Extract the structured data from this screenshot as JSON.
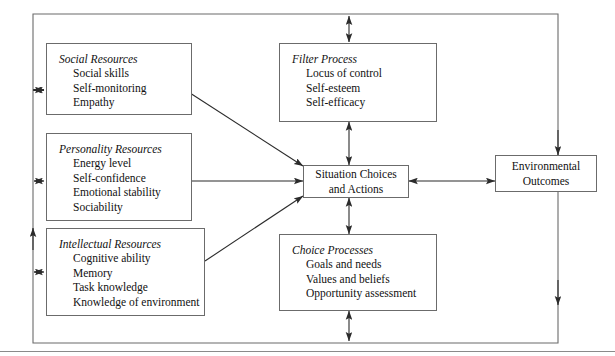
{
  "diagram": {
    "line_color": "#6b6b6b",
    "text_color": "#111111",
    "boxes": {
      "social_resources": {
        "heading": "Social Resources",
        "items": [
          "Social skills",
          "Self-monitoring",
          "Empathy"
        ]
      },
      "personality_resources": {
        "heading": "Personality Resources",
        "items": [
          "Energy level",
          "Self-confidence",
          "Emotional stability",
          "Sociability"
        ]
      },
      "intellectual_resources": {
        "heading": "Intellectual Resources",
        "items": [
          "Cognitive ability",
          "Memory",
          "Task knowledge",
          "Knowledge of environment"
        ]
      },
      "filter_process": {
        "heading": "Filter Process",
        "items": [
          "Locus of control",
          "Self-esteem",
          "Self-efficacy"
        ]
      },
      "choice_processes": {
        "heading": "Choice Processes",
        "items": [
          "Goals and needs",
          "Values and beliefs",
          "Opportunity assessment"
        ]
      },
      "situation_choices": {
        "line1": "Situation Choices",
        "line2": "and Actions"
      },
      "environmental_outcomes": {
        "line1": "Environmental",
        "line2": "Outcomes"
      }
    }
  }
}
